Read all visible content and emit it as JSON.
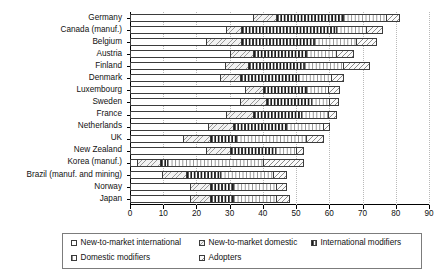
{
  "chart_data": {
    "type": "bar",
    "orientation": "horizontal",
    "stacked": true,
    "title": "",
    "xlabel": "",
    "ylabel": "",
    "xlim": [
      0,
      90
    ],
    "xticks": [
      0,
      10,
      20,
      30,
      40,
      50,
      60,
      70,
      80,
      90
    ],
    "grid": true,
    "legend_position": "bottom",
    "categories": [
      "Germany",
      "Canada (manuf.)",
      "Belgium",
      "Austria",
      "Finland",
      "Denmark",
      "Luxembourg",
      "Sweden",
      "France",
      "Netherlands",
      "UK",
      "New Zealand",
      "Korea (manuf.)",
      "Brazil (manuf. and mining)",
      "Norway",
      "Japan"
    ],
    "series": [
      {
        "name": "New-to-market international",
        "pattern": "p1",
        "values": [
          37.0,
          29.0,
          23.0,
          30.0,
          28.5,
          27.0,
          34.5,
          33.0,
          29.0,
          23.5,
          16.0,
          23.0,
          2.0,
          9.5,
          18.0,
          0
        ]
      },
      {
        "name": "New-to-market domestic",
        "pattern": "p2",
        "values": [
          7.0,
          4.5,
          10.5,
          7.0,
          7.0,
          6.0,
          5.5,
          8.0,
          8.0,
          7.5,
          8.0,
          7.0,
          7.0,
          7.5,
          6.0,
          0
        ]
      },
      {
        "name": "International modifiers",
        "pattern": "p3",
        "values": [
          20.0,
          28.5,
          22.0,
          16.0,
          17.0,
          17.5,
          13.0,
          13.5,
          14.5,
          16.0,
          8.0,
          13.5,
          2.0,
          10.0,
          7.0,
          0
        ]
      },
      {
        "name": "Domestic modifiers",
        "pattern": "p4",
        "values": [
          13.0,
          9.0,
          12.5,
          9.0,
          11.5,
          10.0,
          6.5,
          5.5,
          8.0,
          11.0,
          21.0,
          6.5,
          29.0,
          16.0,
          13.0,
          0
        ]
      },
      {
        "name": "Adopters",
        "pattern": "p5",
        "values": [
          4.0,
          5.0,
          6.0,
          5.0,
          8.0,
          3.5,
          3.5,
          2.5,
          2.5,
          2.0,
          5.0,
          2.0,
          12.0,
          4.0,
          3.0,
          0
        ]
      }
    ],
    "totals": [
      81.0,
      76.0,
      74.0,
      67.0,
      72.0,
      64.0,
      63.0,
      62.5,
      62.0,
      60.0,
      58.0,
      52.0,
      52.0,
      47.0,
      47.0,
      48.0
    ]
  },
  "legend": {
    "row1": [
      {
        "label": "New-to-market international",
        "pattern": "p1"
      },
      {
        "label": "New-to-market domestic",
        "pattern": "p2"
      },
      {
        "label": "International modifiers",
        "pattern": "p3"
      }
    ],
    "row2": [
      {
        "label": "Domestic modifiers",
        "pattern": "p4"
      },
      {
        "label": "Adopters",
        "pattern": "p5"
      }
    ]
  }
}
